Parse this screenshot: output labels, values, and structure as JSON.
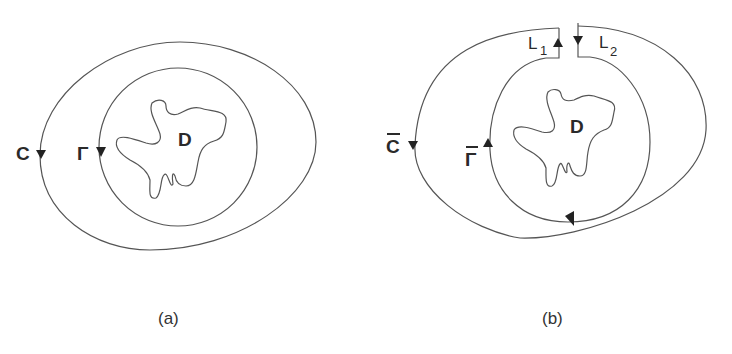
{
  "figure": {
    "panels": [
      {
        "id": "a",
        "caption": "(a)",
        "labels": {
          "outer_curve": "C",
          "inner_curve": "Γ",
          "domain": "D"
        }
      },
      {
        "id": "b",
        "caption": "(b)",
        "labels": {
          "outer_curve": "C",
          "inner_curve": "Γ",
          "domain": "D",
          "cut_left": "L",
          "cut_left_sub": "1",
          "cut_right": "L",
          "cut_right_sub": "2"
        }
      }
    ],
    "colors": {
      "stroke": "#555555",
      "text": "#2a2a2a",
      "background": "#ffffff"
    }
  }
}
